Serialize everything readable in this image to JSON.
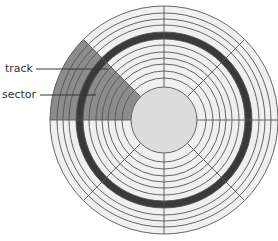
{
  "diagram": {
    "center": [
      164,
      120
    ],
    "outer_radius": 114,
    "hub_radius": 33,
    "track_radii": [
      114,
      107,
      101,
      95,
      88,
      81,
      75,
      68,
      62,
      56,
      49,
      42
    ],
    "highlighted_track": {
      "inner_radius": 81,
      "outer_radius": 88
    },
    "sector_count": 8,
    "divider_angles_deg": [
      0,
      45,
      90,
      135,
      180,
      225,
      270,
      315
    ],
    "highlighted_sector": {
      "start_deg": 135,
      "end_deg": 180
    },
    "colors": {
      "disc_fill": "#f0f0f0",
      "line": "#555555",
      "sector_fill": "#8c8c8c",
      "track_band": "#3a3a3a",
      "hub_fill": "#dcdcdc"
    }
  },
  "labels": {
    "track": "track",
    "sector": "sector"
  }
}
